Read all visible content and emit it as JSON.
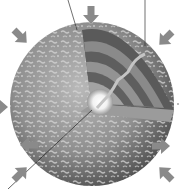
{
  "diagram": {
    "colors": {
      "background": "#ffffff",
      "arrow": "#8a8a8a",
      "surface_dark": "#5a5a5a",
      "surface_mid": "#8c8c8c",
      "surface_light": "#c8c8c8",
      "layer_dark": "#555555",
      "layer_light": "#9a9a9a",
      "core": "#ffffff",
      "leader_line": "#333333",
      "photon_path": "#bdbdbd"
    },
    "sphere": {
      "cx": 92,
      "cy": 104,
      "r": 82
    },
    "arrows": [
      {
        "name": "arrow-top",
        "x": 91,
        "y": 14,
        "angle": 90
      },
      {
        "name": "arrow-top-left",
        "x": 22,
        "y": 38,
        "angle": 45
      },
      {
        "name": "arrow-top-right",
        "x": 160,
        "y": 38,
        "angle": 135
      },
      {
        "name": "arrow-left",
        "x": 2,
        "y": 107,
        "angle": 0
      },
      {
        "name": "arrow-lower-left-inner",
        "x": 28,
        "y": 145,
        "angle": 180
      },
      {
        "name": "arrow-lower-right-inner",
        "x": 160,
        "y": 146,
        "angle": 0
      },
      {
        "name": "arrow-bottom-left",
        "x": 22,
        "y": 172,
        "angle": -45
      },
      {
        "name": "arrow-bottom-right",
        "x": 162,
        "y": 172,
        "angle": -135
      }
    ]
  }
}
